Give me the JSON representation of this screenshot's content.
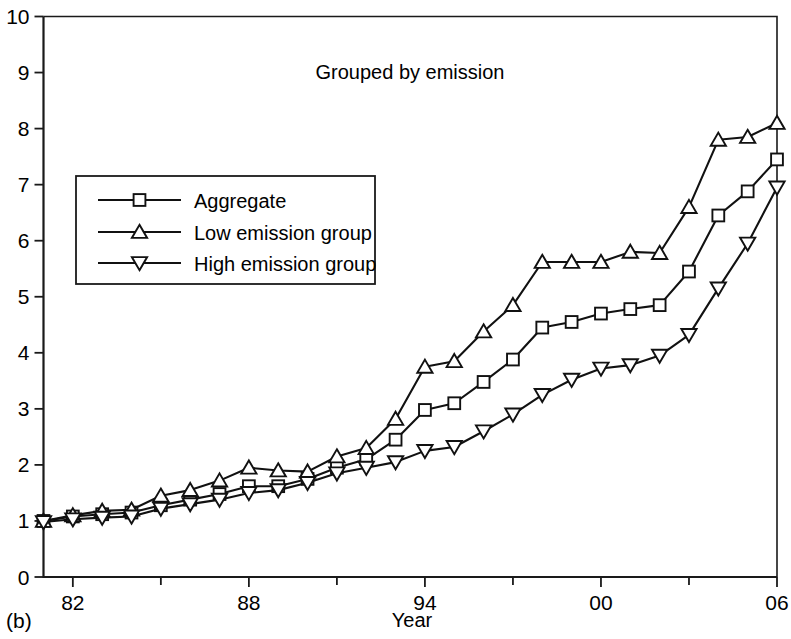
{
  "panel": {
    "label": "(b)"
  },
  "chart_data": {
    "type": "line",
    "title": "Grouped by emission",
    "xlabel": "Year",
    "ylabel": "",
    "grid": false,
    "legend_position": "upper left",
    "xlim": [
      1981,
      2006
    ],
    "ylim": [
      0,
      10
    ],
    "ytick_labels": [
      "0",
      "1",
      "2",
      "3",
      "4",
      "5",
      "6",
      "7",
      "8",
      "9",
      "10"
    ],
    "ytick_values": [
      0,
      1,
      2,
      3,
      4,
      5,
      6,
      7,
      8,
      9,
      10
    ],
    "xtick_labels": [
      "82",
      "88",
      "94",
      "00",
      "06"
    ],
    "xtick_values": [
      1982,
      1988,
      1994,
      2000,
      2006
    ],
    "xminor_tick_values": [
      1985,
      1991,
      1997,
      2003
    ],
    "x": [
      1981,
      1982,
      1983,
      1984,
      1985,
      1986,
      1987,
      1988,
      1989,
      1990,
      1991,
      1992,
      1993,
      1994,
      1995,
      1996,
      1997,
      1998,
      1999,
      2000,
      2001,
      2002,
      2003,
      2004,
      2005,
      2006
    ],
    "series": [
      {
        "name": "Aggregate",
        "marker": "square",
        "values": [
          1.0,
          1.08,
          1.12,
          1.15,
          1.28,
          1.38,
          1.48,
          1.62,
          1.62,
          1.75,
          1.95,
          2.1,
          2.45,
          2.98,
          3.1,
          3.48,
          3.88,
          4.45,
          4.55,
          4.7,
          4.78,
          4.85,
          5.45,
          6.45,
          6.88,
          7.45
        ]
      },
      {
        "name": "Low emission group",
        "marker": "triangle-up",
        "values": [
          1.0,
          1.1,
          1.18,
          1.2,
          1.45,
          1.55,
          1.72,
          1.95,
          1.9,
          1.88,
          2.15,
          2.3,
          2.82,
          3.75,
          3.85,
          4.38,
          4.85,
          5.62,
          5.62,
          5.62,
          5.8,
          5.78,
          6.6,
          7.8,
          7.85,
          8.1
        ]
      },
      {
        "name": "High emission group",
        "marker": "triangle-down",
        "values": [
          0.98,
          1.03,
          1.06,
          1.08,
          1.22,
          1.3,
          1.38,
          1.5,
          1.55,
          1.68,
          1.85,
          1.95,
          2.05,
          2.25,
          2.32,
          2.6,
          2.9,
          3.25,
          3.52,
          3.72,
          3.78,
          3.95,
          4.32,
          5.15,
          5.95,
          6.95
        ]
      }
    ]
  },
  "legend": {
    "entries": [
      {
        "label": "Aggregate",
        "marker": "square"
      },
      {
        "label": "Low emission group",
        "marker": "triangle-up"
      },
      {
        "label": "High emission group",
        "marker": "triangle-down"
      }
    ]
  }
}
